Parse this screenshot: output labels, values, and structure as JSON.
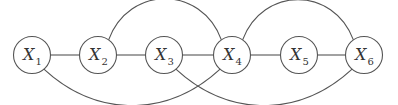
{
  "diagram": {
    "type": "undirected-graph",
    "nodes": [
      {
        "id": "X1",
        "label": "X",
        "subscript": "1"
      },
      {
        "id": "X2",
        "label": "X",
        "subscript": "2"
      },
      {
        "id": "X3",
        "label": "X",
        "subscript": "3"
      },
      {
        "id": "X4",
        "label": "X",
        "subscript": "4"
      },
      {
        "id": "X5",
        "label": "X",
        "subscript": "5"
      },
      {
        "id": "X6",
        "label": "X",
        "subscript": "6"
      }
    ],
    "edges": [
      {
        "from": "X1",
        "to": "X2",
        "style": "straight"
      },
      {
        "from": "X2",
        "to": "X3",
        "style": "straight"
      },
      {
        "from": "X3",
        "to": "X4",
        "style": "straight"
      },
      {
        "from": "X4",
        "to": "X5",
        "style": "straight"
      },
      {
        "from": "X5",
        "to": "X6",
        "style": "straight"
      },
      {
        "from": "X2",
        "to": "X4",
        "style": "arc-above"
      },
      {
        "from": "X4",
        "to": "X6",
        "style": "arc-above"
      },
      {
        "from": "X1",
        "to": "X4",
        "style": "arc-below"
      },
      {
        "from": "X3",
        "to": "X6",
        "style": "arc-below"
      }
    ],
    "colors": {
      "stroke": "#555555",
      "text": "#333333"
    }
  }
}
